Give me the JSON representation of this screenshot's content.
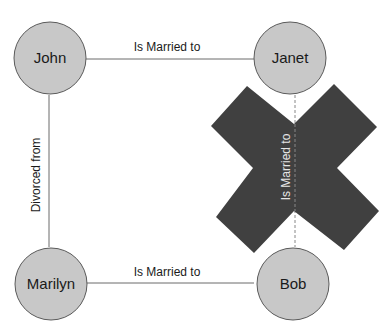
{
  "nodes": {
    "john": {
      "label": "John"
    },
    "janet": {
      "label": "Janet"
    },
    "marilyn": {
      "label": "Marilyn"
    },
    "bob": {
      "label": "Bob"
    }
  },
  "edges": {
    "john_janet": {
      "label": "Is Married to"
    },
    "john_marilyn": {
      "label": "Divorced from"
    },
    "marilyn_bob": {
      "label": "Is Married to"
    },
    "janet_bob": {
      "label": "Is Married to",
      "crossed_out": true
    }
  },
  "colors": {
    "node_fill": "#c8c8c8",
    "node_stroke": "#5a5a5a",
    "edge": "#6a6a6a",
    "cross": "#3a3a3a"
  }
}
